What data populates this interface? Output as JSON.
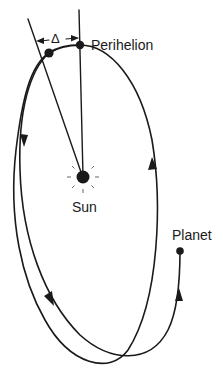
{
  "diagram": {
    "labels": {
      "delta": "Δ",
      "perihelion": "Perihelion",
      "sun": "Sun",
      "planet": "Planet"
    },
    "colors": {
      "ink": "#1a1a1a",
      "background": "#ffffff"
    }
  }
}
